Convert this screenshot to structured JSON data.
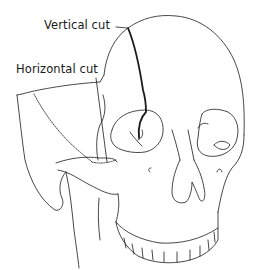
{
  "figure": {
    "background_color": "#ffffff",
    "line_color": "#1a1a1a",
    "labels": {
      "vertical_cut": "Vertical cut",
      "horizontal_cut": "Horizontal cut"
    }
  }
}
